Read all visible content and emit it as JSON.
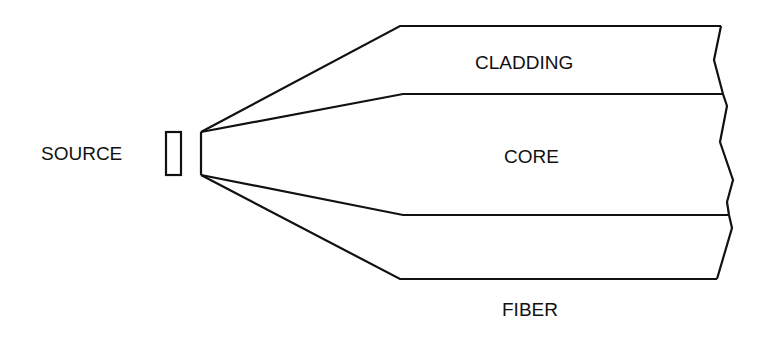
{
  "diagram": {
    "type": "optical-fiber-coupling-schematic",
    "labels": {
      "source": "SOURCE",
      "cladding": "CLADDING",
      "core": "CORE",
      "fiber": "FIBER"
    },
    "colors": {
      "line": "#111111",
      "background": "#ffffff",
      "text": "#111111"
    },
    "elements": [
      {
        "name": "source",
        "shape": "rectangle",
        "label": "SOURCE"
      },
      {
        "name": "light-cone-outer",
        "shape": "diverging-lines",
        "description": "rays from source to cladding boundary"
      },
      {
        "name": "light-cone-inner",
        "shape": "diverging-lines",
        "description": "rays from source to core boundary"
      },
      {
        "name": "cladding-region",
        "label": "CLADDING"
      },
      {
        "name": "core-region",
        "label": "CORE"
      },
      {
        "name": "fiber",
        "label": "FIBER",
        "end": "jagged-break"
      }
    ]
  }
}
